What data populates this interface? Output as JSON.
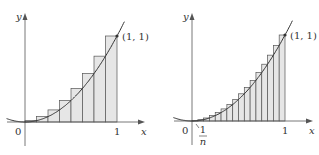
{
  "colors": {
    "axis": "#555555",
    "curve": "#333333",
    "rect_fill": "#e6e6e6",
    "rect_stroke": "#555555"
  },
  "plots": [
    {
      "n": 8,
      "origin": [
        25,
        122
      ],
      "unit": [
        92,
        86
      ],
      "labels": {
        "y": "y",
        "x": "x",
        "zero": "0",
        "one": "1",
        "point": "(1, 1)"
      }
    },
    {
      "n": 16,
      "origin": [
        192,
        121
      ],
      "unit": [
        93,
        86
      ],
      "labels": {
        "y": "y",
        "x": "x",
        "zero": "0",
        "one": "1",
        "point": "(1, 1)",
        "frac_num": "1",
        "frac_den": "n"
      }
    }
  ]
}
